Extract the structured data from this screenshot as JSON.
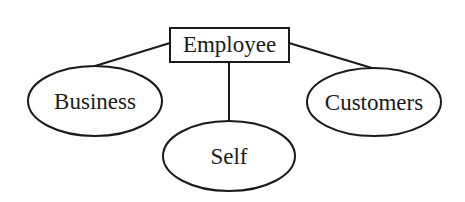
{
  "diagram": {
    "root": {
      "label": "Employee",
      "shape": "rectangle"
    },
    "children": [
      {
        "label": "Business",
        "shape": "ellipse"
      },
      {
        "label": "Self",
        "shape": "ellipse"
      },
      {
        "label": "Customers",
        "shape": "ellipse"
      }
    ],
    "colors": {
      "stroke": "#1a1a1a",
      "background": "#ffffff"
    }
  }
}
